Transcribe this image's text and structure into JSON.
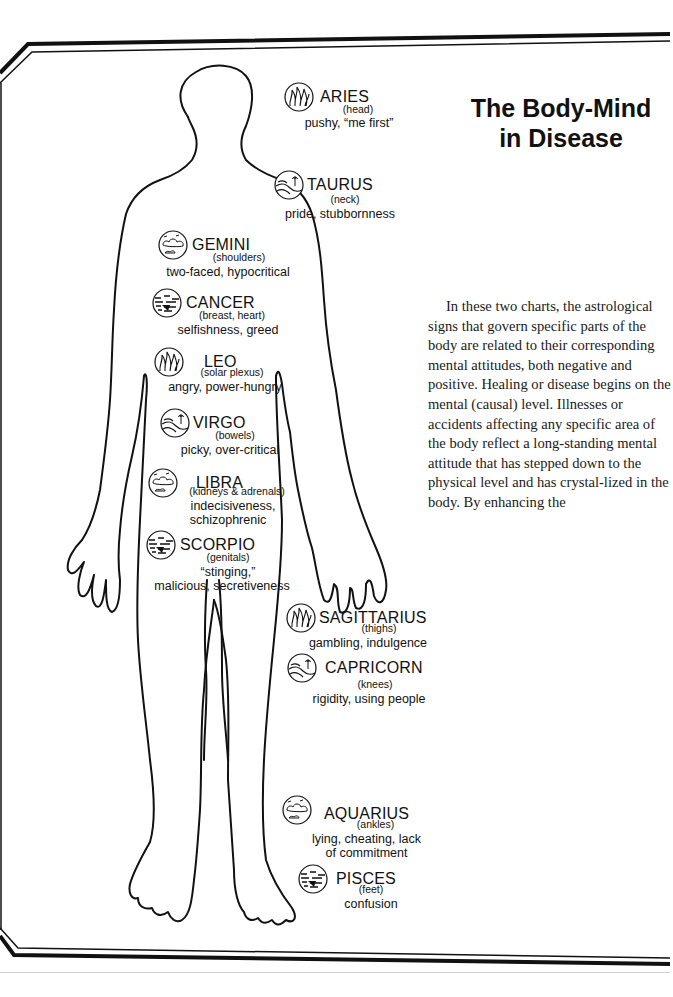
{
  "title": {
    "line1": "The Body-Mind",
    "line2": "in Disease"
  },
  "body_text": "In these two charts, the astrological signs that govern specific parts of the body are related to their corresponding mental attitudes, both negative and positive. Healing or disease begins on the mental (causal) level. Illnesses or accidents affecting any specific area of the body reflect a long-standing mental attitude that has stepped down to the physical level and has crystal-lized in the body. By enhancing the",
  "signs": [
    {
      "name": "ARIES",
      "part": "(head)",
      "trait": "pushy, “me first”",
      "icon": "fire-icon",
      "element": "fire"
    },
    {
      "name": "TAURUS",
      "part": "(neck)",
      "trait": "pride, stubbornness",
      "icon": "earth-icon",
      "element": "earth"
    },
    {
      "name": "GEMINI",
      "part": "(shoulders)",
      "trait": "two-faced, hypocritical",
      "icon": "air-icon",
      "element": "air"
    },
    {
      "name": "CANCER",
      "part": "(breast, heart)",
      "trait": "selfishness, greed",
      "icon": "water-icon",
      "element": "water"
    },
    {
      "name": "LEO",
      "part": "(solar plexus)",
      "trait": "angry, power-hungry",
      "icon": "fire-icon",
      "element": "fire"
    },
    {
      "name": "VIRGO",
      "part": "(bowels)",
      "trait": "picky, over-critical",
      "icon": "earth-icon",
      "element": "earth"
    },
    {
      "name": "LIBRA",
      "part": "(kidneys & adrenals)",
      "trait": "indecisiveness,",
      "trait2": "schizophrenic",
      "icon": "air-icon",
      "element": "air"
    },
    {
      "name": "SCORPIO",
      "part": "(genitals)",
      "trait": "“stinging,”",
      "trait2": "malicious, secretiveness",
      "icon": "water-icon",
      "element": "water"
    },
    {
      "name": "SAGITTARIUS",
      "part": "(thighs)",
      "trait": "gambling, indulgence",
      "icon": "fire-icon",
      "element": "fire"
    },
    {
      "name": "CAPRICORN",
      "part": "(knees)",
      "trait": "rigidity, using people",
      "icon": "earth-icon",
      "element": "earth"
    },
    {
      "name": "AQUARIUS",
      "part": "(ankles)",
      "trait": "lying, cheating, lack",
      "trait2": "of commitment",
      "icon": "air-icon",
      "element": "air"
    },
    {
      "name": "PISCES",
      "part": "(feet)",
      "trait": "confusion",
      "icon": "water-icon",
      "element": "water"
    }
  ],
  "colors": {
    "ink": "#111111",
    "paper": "#ffffff",
    "rule": "#cfcfcf"
  }
}
